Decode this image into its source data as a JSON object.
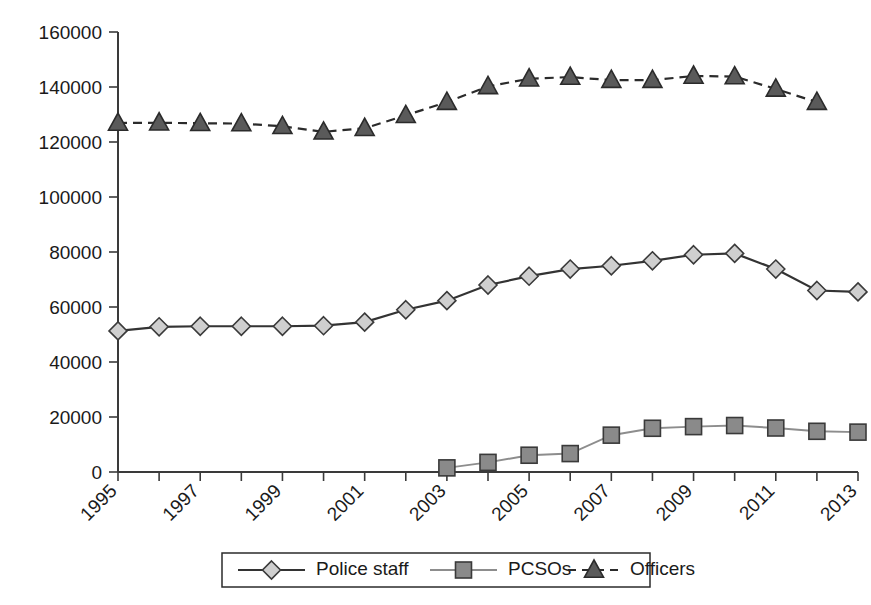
{
  "chart_data": {
    "type": "line",
    "title": "",
    "subtitle": "",
    "xlabel": "",
    "ylabel": "",
    "x": [
      1995,
      1996,
      1997,
      1998,
      1999,
      2000,
      2001,
      2002,
      2003,
      2004,
      2005,
      2006,
      2007,
      2008,
      2009,
      2010,
      2011,
      2012,
      2013
    ],
    "tick_labels": [
      "1995",
      "1996",
      "1997",
      "1998",
      "1999",
      "2000",
      "2001",
      "2002",
      "2003",
      "2004",
      "2005",
      "2006",
      "2007",
      "2008",
      "2009",
      "2010",
      "2011",
      "2012",
      "2013"
    ],
    "visible_tick_labels": [
      "1995",
      "1997",
      "1999",
      "2001",
      "2003",
      "2005",
      "2007",
      "2009",
      "2011",
      "2013"
    ],
    "ytick_labels": [
      "0",
      "20000",
      "40000",
      "60000",
      "80000",
      "100000",
      "120000",
      "140000",
      "160000"
    ],
    "ytick_values": [
      0,
      20000,
      40000,
      60000,
      80000,
      100000,
      120000,
      140000,
      160000
    ],
    "ylim": [
      0,
      160000
    ],
    "xlim": [
      1995,
      2013
    ],
    "grid": false,
    "legend_position": "bottom",
    "series": [
      {
        "name": "Police staff",
        "marker": "diamond",
        "line_style": "solid",
        "line_color": "#333333",
        "marker_fill": "#cfcfcf",
        "marker_stroke": "#3a3a3a",
        "x": [
          1995,
          1996,
          1997,
          1998,
          1999,
          2000,
          2001,
          2002,
          2003,
          2004,
          2005,
          2006,
          2007,
          2008,
          2009,
          2010,
          2011,
          2012,
          2013
        ],
        "values": [
          51300,
          52800,
          53000,
          53000,
          53000,
          53200,
          54500,
          59000,
          62300,
          68000,
          71200,
          73800,
          75000,
          76800,
          79000,
          79500,
          73800,
          66000,
          65500
        ]
      },
      {
        "name": "PCSOs",
        "marker": "square",
        "line_style": "solid",
        "line_color": "#8d8d8d",
        "marker_fill": "#8a8a8a",
        "marker_stroke": "#3a3a3a",
        "x": [
          2003,
          2004,
          2005,
          2006,
          2007,
          2008,
          2009,
          2010,
          2011,
          2012,
          2013
        ],
        "values": [
          1500,
          3500,
          6100,
          6700,
          13400,
          15900,
          16500,
          16900,
          16000,
          14800,
          14500
        ]
      },
      {
        "name": "Officers",
        "marker": "triangle",
        "line_style": "dashed",
        "line_color": "#2b2b2b",
        "marker_fill": "#5a5a5a",
        "marker_stroke": "#2b2b2b",
        "x": [
          1995,
          1996,
          1997,
          1998,
          1999,
          2000,
          2001,
          2002,
          2003,
          2004,
          2005,
          2006,
          2007,
          2008,
          2009,
          2010,
          2011,
          2012
        ],
        "values": [
          126900,
          127000,
          126800,
          126700,
          125700,
          123700,
          125000,
          129700,
          134500,
          140200,
          143000,
          143600,
          142500,
          142500,
          144000,
          143800,
          139300,
          134500
        ]
      }
    ]
  },
  "legend": {
    "entries": [
      {
        "label": "Police staff"
      },
      {
        "label": "PCSOs"
      },
      {
        "label": "Officers"
      }
    ]
  }
}
